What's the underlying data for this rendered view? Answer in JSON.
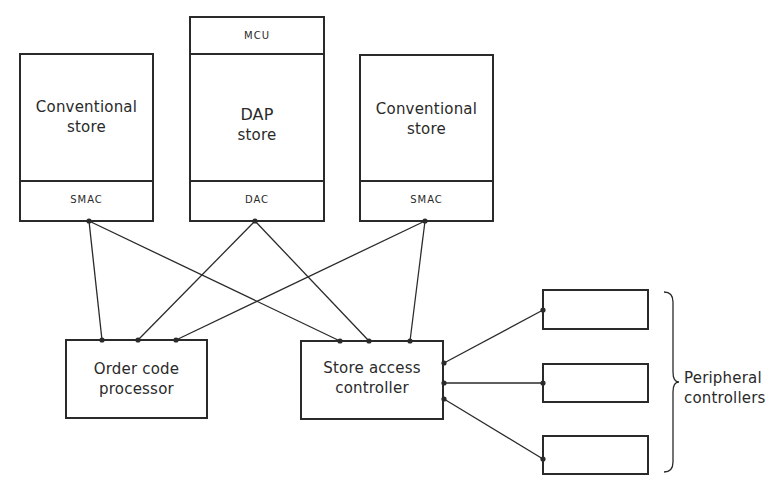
{
  "diagram": {
    "type": "block-diagram",
    "nodes": {
      "left_store": {
        "label_line1": "Conventional",
        "label_line2": "store",
        "sub_label": "SMAC"
      },
      "dap_store": {
        "top_label": "MCU",
        "label_line1": "DAP",
        "label_line2": "store",
        "sub_label": "DAC"
      },
      "right_store": {
        "label_line1": "Conventional",
        "label_line2": "store",
        "sub_label": "SMAC"
      },
      "order_code_processor": {
        "label_line1": "Order code",
        "label_line2": "processor"
      },
      "store_access_controller": {
        "label_line1": "Store access",
        "label_line2": "controller"
      },
      "peripherals": {
        "count": 3,
        "label_line1": "Peripheral",
        "label_line2": "controllers"
      }
    },
    "edges": [
      [
        "left_store.SMAC",
        "order_code_processor"
      ],
      [
        "left_store.SMAC",
        "store_access_controller"
      ],
      [
        "dap_store.DAC",
        "order_code_processor"
      ],
      [
        "dap_store.DAC",
        "store_access_controller"
      ],
      [
        "right_store.SMAC",
        "order_code_processor"
      ],
      [
        "right_store.SMAC",
        "store_access_controller"
      ],
      [
        "store_access_controller",
        "peripheral_1"
      ],
      [
        "store_access_controller",
        "peripheral_2"
      ],
      [
        "store_access_controller",
        "peripheral_3"
      ]
    ]
  }
}
